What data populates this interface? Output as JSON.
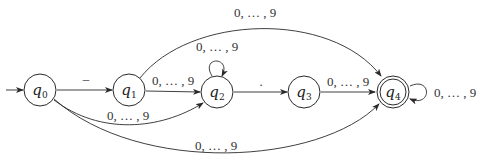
{
  "diagram": {
    "type": "finite-automaton",
    "states": [
      {
        "id": "q0",
        "name": "q",
        "sub": "0",
        "cx": 40,
        "cy": 90,
        "start": true,
        "accepting": false
      },
      {
        "id": "q1",
        "name": "q",
        "sub": "1",
        "cx": 129,
        "cy": 90,
        "start": false,
        "accepting": false
      },
      {
        "id": "q2",
        "name": "q",
        "sub": "2",
        "cx": 217,
        "cy": 92,
        "start": false,
        "accepting": false
      },
      {
        "id": "q3",
        "name": "q",
        "sub": "3",
        "cx": 304,
        "cy": 92,
        "start": false,
        "accepting": false
      },
      {
        "id": "q4",
        "name": "q",
        "sub": "4",
        "cx": 393,
        "cy": 92,
        "start": false,
        "accepting": true
      }
    ],
    "transitions": [
      {
        "from": "q0",
        "to": "q1",
        "label": "–"
      },
      {
        "from": "q1",
        "to": "q2",
        "label": "0, … , 9"
      },
      {
        "from": "q2",
        "to": "q2",
        "label": "0, … , 9"
      },
      {
        "from": "q0",
        "to": "q2",
        "label": "0, … , 9"
      },
      {
        "from": "q2",
        "to": "q3",
        "label": "."
      },
      {
        "from": "q3",
        "to": "q4",
        "label": "0, … , 9"
      },
      {
        "from": "q1",
        "to": "q4",
        "label": "0, … , 9"
      },
      {
        "from": "q0",
        "to": "q4",
        "label": "0, … , 9"
      },
      {
        "from": "q4",
        "to": "q4",
        "label": "0, … , 9"
      }
    ]
  },
  "labels": {
    "q0_q1": "–",
    "q1_q2": "0, … , 9",
    "q2_loop": "0, … , 9",
    "q0_q2": "0, … , 9",
    "q2_q3": ".",
    "q3_q4": "0, … , 9",
    "q1_q4": "0, … , 9",
    "q0_q4": "0, … , 9",
    "q4_loop": "0, … , 9"
  },
  "states": {
    "q0": {
      "name": "q",
      "sub": "0"
    },
    "q1": {
      "name": "q",
      "sub": "1"
    },
    "q2": {
      "name": "q",
      "sub": "2"
    },
    "q3": {
      "name": "q",
      "sub": "3"
    },
    "q4": {
      "name": "q",
      "sub": "4"
    }
  }
}
